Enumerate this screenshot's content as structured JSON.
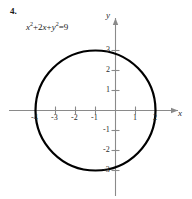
{
  "exercise": {
    "number": "4.",
    "equation_plain": "x² + 2x + y² = 9",
    "equation_parts": {
      "x_var": "x",
      "exp2_a": "2",
      "plus1": "+",
      "coef2": "2",
      "x_var2": "x",
      "plus2": "+",
      "y_var": "y",
      "exp2_b": "2",
      "equals": "=",
      "rhs": "9"
    }
  },
  "chart_data": {
    "type": "scatter",
    "xlabel": "x",
    "ylabel": "y",
    "xlim": [
      -4.9,
      3.0
    ],
    "ylim": [
      -4.3,
      3.9
    ],
    "grid": false,
    "legend": null,
    "curve": {
      "shape": "circle",
      "center_x": -1,
      "center_y": 0,
      "radius": 3,
      "equation_standard": "(x + 1)² + y² = 9",
      "x_intercepts": [
        -4,
        2
      ],
      "y_intercepts": [
        -2.828,
        2.828
      ],
      "stroke": "#000000",
      "stroke_width": 2.2,
      "fill": "none"
    },
    "x_ticks": [
      -4,
      -3,
      -2,
      -1,
      1,
      2
    ],
    "x_tick_labels": [
      "-4",
      "-3",
      "-2",
      "-1",
      "1",
      "2"
    ],
    "y_ticks": [
      3,
      2,
      1,
      -1,
      -2,
      -3
    ],
    "y_tick_labels": [
      "3",
      "2",
      "1",
      "-1",
      "-2",
      "-3"
    ],
    "axis_color": "#8a8a8a",
    "axis_arrow_x": true,
    "axis_arrow_y": true
  }
}
